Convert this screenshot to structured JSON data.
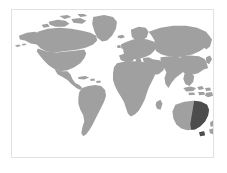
{
  "figure": {
    "type": "world-locator-map",
    "caption": "",
    "background_color": "#ffffff",
    "frame_color": "#e2e2e2",
    "land_color": "#a0a0a0",
    "highlight_color": "#4d4d4d",
    "ocean_color": "#ffffff",
    "projection": "equirectangular"
  },
  "map": {
    "frame": {
      "x": 11,
      "y": 9,
      "width": 203,
      "height": 149
    },
    "regions": [
      {
        "name": "north-america",
        "label": "North America",
        "fill": "land"
      },
      {
        "name": "greenland",
        "label": "Greenland",
        "fill": "land"
      },
      {
        "name": "south-america",
        "label": "South America",
        "fill": "land"
      },
      {
        "name": "africa",
        "label": "Africa",
        "fill": "land"
      },
      {
        "name": "europe",
        "label": "Europe",
        "fill": "land"
      },
      {
        "name": "asia",
        "label": "Asia",
        "fill": "land"
      },
      {
        "name": "southeast-asia",
        "label": "Southeast Asia",
        "fill": "land"
      },
      {
        "name": "australia",
        "label": "Australia",
        "fill": "land"
      },
      {
        "name": "new-zealand",
        "label": "New Zealand",
        "fill": "land"
      },
      {
        "name": "japan",
        "label": "Japan",
        "fill": "land"
      },
      {
        "name": "british-isles",
        "label": "British Isles",
        "fill": "land"
      },
      {
        "name": "madagascar",
        "label": "Madagascar",
        "fill": "land"
      }
    ],
    "highlighted_regions": [
      {
        "name": "eastern-australia",
        "label": "Eastern Australia",
        "fill": "highlight"
      }
    ]
  }
}
